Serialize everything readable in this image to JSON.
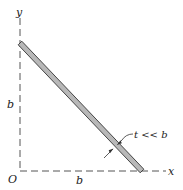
{
  "diagram": {
    "axes": {
      "x_label": "x",
      "y_label": "y",
      "origin_label": "O"
    },
    "dimensions": {
      "horizontal_length_label": "b",
      "vertical_length_label": "b",
      "thickness_label": "t << b"
    },
    "colors": {
      "bar_fill": "#b8b8b8",
      "bar_outline": "#333333",
      "axis_line": "#555555"
    }
  }
}
